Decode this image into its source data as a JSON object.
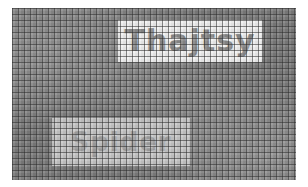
{
  "image": {
    "description": "Pixelated grid mosaic with two obscured text labels",
    "background_color": "#7d7d7d",
    "grid_line_color": "#282828",
    "grid_spacing_px": 6
  },
  "labels": {
    "top": {
      "text": "Thajtsy",
      "box_color": "#f2f2f2",
      "text_color": "#8a8a8a"
    },
    "bottom": {
      "text": "Spider",
      "box_color": "#c8c8c8",
      "text_color": "#a2a2a2"
    }
  }
}
